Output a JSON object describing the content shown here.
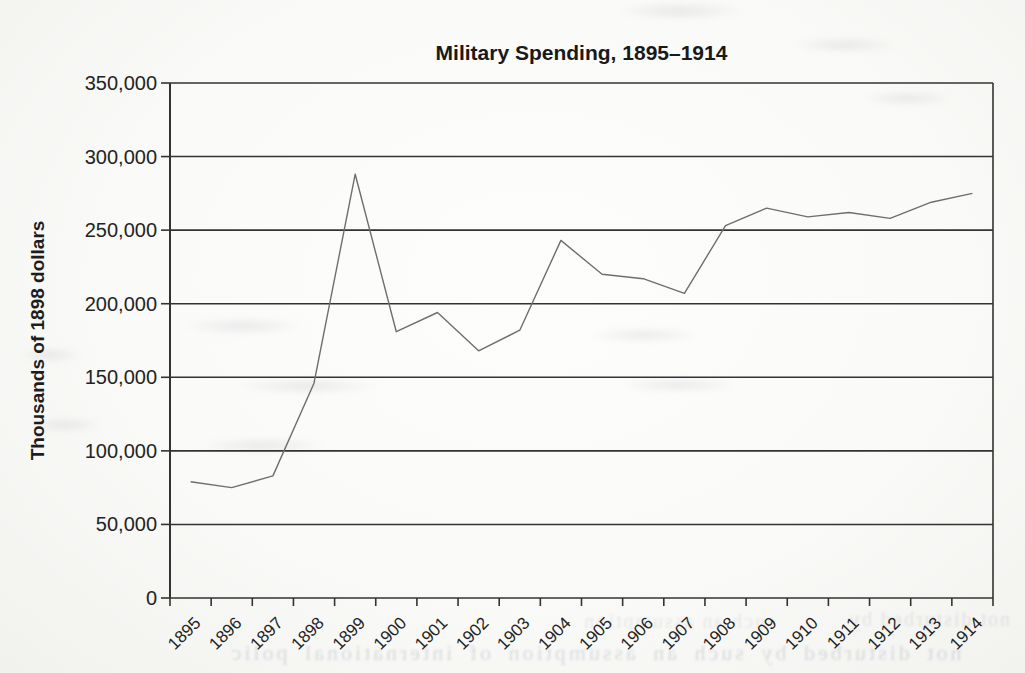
{
  "chart_data": {
    "type": "line",
    "title": "Military Spending, 1895–1914",
    "ylabel": "Thousands of 1898 dollars",
    "xlabel": "",
    "categories": [
      "1895",
      "1896",
      "1897",
      "1898",
      "1899",
      "1900",
      "1901",
      "1902",
      "1903",
      "1904",
      "1905",
      "1906",
      "1907",
      "1908",
      "1909",
      "1910",
      "1911",
      "1912",
      "1913",
      "1914"
    ],
    "values": [
      79000,
      75000,
      83000,
      146000,
      288000,
      181000,
      194000,
      168000,
      182000,
      243000,
      220000,
      217000,
      207000,
      253000,
      265000,
      259000,
      262000,
      258000,
      269000,
      275000
    ],
    "ylim": [
      0,
      350000
    ],
    "ytick_step": 50000,
    "ytick_labels": [
      "0",
      "50,000",
      "100,000",
      "150,000",
      "200,000",
      "250,000",
      "300,000",
      "350,000"
    ],
    "grid": true,
    "legend_position": "none",
    "line_color": "#6e6e6e",
    "grid_color": "#333333"
  },
  "bleed": {
    "fragment1": "not disturbed by such an assumption of international polic",
    "fragment2": "not disturbed by",
    "fragment3": "such an assumption"
  }
}
